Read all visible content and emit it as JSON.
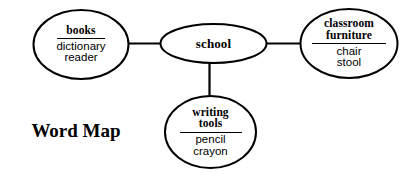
{
  "diagram": {
    "title": "Word Map",
    "type": "word map concept diagram",
    "center": {
      "id": "school",
      "label": "school"
    },
    "branches": [
      {
        "id": "books",
        "heading": "books",
        "items": [
          "dictionary",
          "reader"
        ],
        "position": "left"
      },
      {
        "id": "classroom-furniture",
        "heading_lines": [
          "classroom",
          "furniture"
        ],
        "heading_line_1": "classroom",
        "heading_line_2": "furniture",
        "items": [
          "chair",
          "stool"
        ],
        "position": "right"
      },
      {
        "id": "writing-tools",
        "heading_lines": [
          "writing",
          "tools"
        ],
        "heading_line_1": "writing",
        "heading_line_2": "tools",
        "items": [
          "pencil",
          "crayon"
        ],
        "position": "bottom"
      }
    ],
    "colors": {
      "stroke": "#000000",
      "background": "#ffffff",
      "text": "#000000"
    }
  }
}
